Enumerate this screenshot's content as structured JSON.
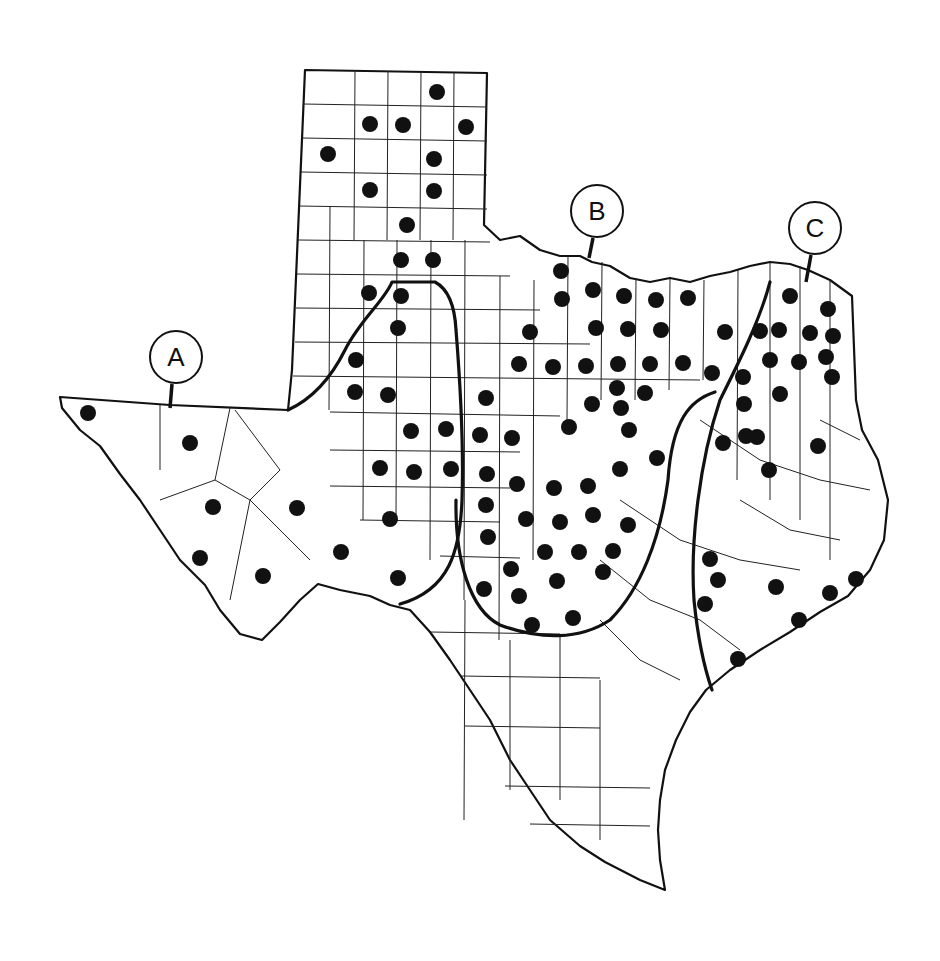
{
  "map": {
    "subject": "Texas county map with occurrence dots and three regional boundary lines",
    "labels": [
      {
        "id": "A",
        "text": "A",
        "cx": 176,
        "cy": 357,
        "leader": [
          172,
          384,
          170,
          408
        ]
      },
      {
        "id": "B",
        "text": "B",
        "cx": 597,
        "cy": 211,
        "leader": [
          593,
          238,
          589,
          258
        ]
      },
      {
        "id": "C",
        "text": "C",
        "cx": 815,
        "cy": 228,
        "leader": [
          811,
          255,
          806,
          282
        ]
      }
    ],
    "colors": {
      "background": "#ffffff",
      "ink": "#111111"
    },
    "dots": [
      [
        437,
        92
      ],
      [
        370,
        124
      ],
      [
        403,
        125
      ],
      [
        466,
        127
      ],
      [
        328,
        154
      ],
      [
        434,
        159
      ],
      [
        370,
        190
      ],
      [
        434,
        191
      ],
      [
        407,
        225
      ],
      [
        401,
        260
      ],
      [
        433,
        260
      ],
      [
        369,
        293
      ],
      [
        401,
        296
      ],
      [
        398,
        328
      ],
      [
        356,
        360
      ],
      [
        355,
        392
      ],
      [
        388,
        395
      ],
      [
        411,
        431
      ],
      [
        446,
        429
      ],
      [
        480,
        435
      ],
      [
        512,
        438
      ],
      [
        380,
        468
      ],
      [
        414,
        472
      ],
      [
        451,
        469
      ],
      [
        487,
        474
      ],
      [
        88,
        413
      ],
      [
        190,
        443
      ],
      [
        213,
        507
      ],
      [
        297,
        508
      ],
      [
        200,
        558
      ],
      [
        263,
        576
      ],
      [
        341,
        552
      ],
      [
        390,
        519
      ],
      [
        398,
        578
      ],
      [
        486,
        398
      ],
      [
        486,
        505
      ],
      [
        488,
        537
      ],
      [
        484,
        589
      ],
      [
        511,
        569
      ],
      [
        519,
        596
      ],
      [
        532,
        625
      ],
      [
        573,
        618
      ],
      [
        517,
        484
      ],
      [
        554,
        488
      ],
      [
        526,
        519
      ],
      [
        560,
        522
      ],
      [
        545,
        552
      ],
      [
        579,
        552
      ],
      [
        557,
        581
      ],
      [
        603,
        572
      ],
      [
        613,
        551
      ],
      [
        628,
        525
      ],
      [
        593,
        515
      ],
      [
        588,
        486
      ],
      [
        561,
        271
      ],
      [
        562,
        299
      ],
      [
        593,
        290
      ],
      [
        624,
        296
      ],
      [
        656,
        300
      ],
      [
        688,
        298
      ],
      [
        530,
        332
      ],
      [
        596,
        328
      ],
      [
        628,
        329
      ],
      [
        661,
        330
      ],
      [
        519,
        364
      ],
      [
        553,
        367
      ],
      [
        586,
        366
      ],
      [
        618,
        364
      ],
      [
        650,
        364
      ],
      [
        683,
        363
      ],
      [
        617,
        388
      ],
      [
        645,
        393
      ],
      [
        621,
        408
      ],
      [
        592,
        404
      ],
      [
        569,
        427
      ],
      [
        629,
        430
      ],
      [
        620,
        469
      ],
      [
        657,
        458
      ],
      [
        712,
        373
      ],
      [
        725,
        332
      ],
      [
        760,
        331
      ],
      [
        779,
        330
      ],
      [
        810,
        333
      ],
      [
        790,
        296
      ],
      [
        828,
        309
      ],
      [
        833,
        336
      ],
      [
        770,
        360
      ],
      [
        799,
        362
      ],
      [
        826,
        357
      ],
      [
        832,
        377
      ],
      [
        743,
        377
      ],
      [
        744,
        404
      ],
      [
        780,
        394
      ],
      [
        746,
        436
      ],
      [
        757,
        437
      ],
      [
        723,
        443
      ],
      [
        769,
        470
      ],
      [
        818,
        446
      ],
      [
        710,
        559
      ],
      [
        718,
        580
      ],
      [
        705,
        604
      ],
      [
        776,
        587
      ],
      [
        830,
        593
      ],
      [
        856,
        579
      ],
      [
        799,
        620
      ],
      [
        738,
        659
      ]
    ]
  }
}
